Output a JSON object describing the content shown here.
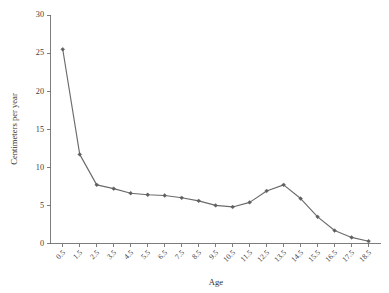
{
  "figure": {
    "background_color": "#ffffff",
    "line_color": "#6b6b6b",
    "marker_color": "#5f5f5f",
    "axis_color": "#6f6f6f",
    "text_color": "#3c3c3c"
  },
  "caption": {
    "text": ""
  },
  "chart_data": {
    "type": "line",
    "title": "",
    "xlabel": "Age",
    "ylabel": "Centimeters per year",
    "x": [
      0.5,
      1.5,
      2.5,
      3.5,
      4.5,
      5.5,
      6.5,
      7.5,
      8.5,
      9.5,
      10.5,
      11.5,
      12.5,
      13.5,
      14.5,
      15.5,
      16.5,
      17.5,
      18.5
    ],
    "categories": [
      "0.5",
      "1.5",
      "2.5",
      "3.5",
      "4.5",
      "5.5",
      "6.5",
      "7.5",
      "8.5",
      "9.5",
      "10.5",
      "11.5",
      "12.5",
      "13.5",
      "14.5",
      "15.5",
      "16.5",
      "17.5",
      "18.5"
    ],
    "values": [
      25.5,
      11.7,
      7.7,
      7.2,
      6.6,
      6.4,
      6.3,
      6.0,
      5.6,
      5.0,
      4.8,
      5.4,
      6.9,
      7.7,
      5.9,
      3.5,
      1.7,
      0.8,
      0.3
    ],
    "series": [
      {
        "name": "Growth velocity",
        "values": [
          25.5,
          11.7,
          7.7,
          7.2,
          6.6,
          6.4,
          6.3,
          6.0,
          5.6,
          5.0,
          4.8,
          5.4,
          6.9,
          7.7,
          5.9,
          3.5,
          1.7,
          0.8,
          0.3
        ]
      }
    ],
    "ylim": [
      0,
      30
    ],
    "yticks": [
      0,
      5,
      10,
      15,
      20,
      25,
      30
    ],
    "ytick_labels": [
      "0",
      "5",
      "10",
      "15",
      "20",
      "25",
      "30"
    ],
    "xtick_labels_rotation": -45,
    "grid": false,
    "legend": false,
    "legend_position": "none",
    "marker": "diamond"
  }
}
